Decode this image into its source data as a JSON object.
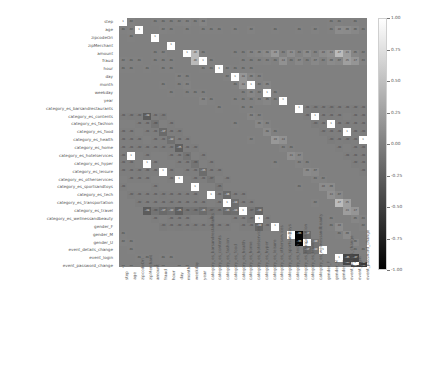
{
  "chart_data": {
    "type": "heatmap",
    "title": "",
    "xlabel": "",
    "ylabel": "",
    "grid": false,
    "legend_position": "right",
    "colormap": "gray",
    "annotated": true,
    "vmin": -1.0,
    "vmax": 1.0,
    "colorbar": {
      "ticks": [
        "1.00",
        "0.75",
        "0.50",
        "0.25",
        "0.00",
        "-0.25",
        "-0.50",
        "-0.75",
        "-1.00"
      ],
      "tick_values": [
        1.0,
        0.75,
        0.5,
        0.25,
        0.0,
        -0.25,
        -0.5,
        -0.75,
        -1.0
      ],
      "top_color": "#ffffff",
      "bottom_color": "#000000"
    },
    "categories": [
      "step",
      "age",
      "zipcodeOri",
      "zipMerchant",
      "amount",
      "fraud",
      "hour",
      "day",
      "month",
      "weekday",
      "year",
      "category_es_barsandrestaurants",
      "category_es_contents",
      "category_es_fashion",
      "category_es_food",
      "category_es_health",
      "category_es_home",
      "category_es_hotelservices",
      "category_es_hyper",
      "category_es_leisure",
      "category_es_otherservices",
      "category_es_sportsandtoys",
      "category_es_tech",
      "category_es_transportation",
      "category_es_travel",
      "category_es_wellnessandbeauty",
      "gender_F",
      "gender_M",
      "gender_U",
      "event_details_change",
      "event_login",
      "event_password_change"
    ],
    "xticklabels": [
      "step",
      "age",
      "zipcodeOri",
      "zipMerchant",
      "amount",
      "fraud",
      "hour",
      "day",
      "month",
      "weekday",
      "year",
      "category_es_barsandrestaurants",
      "category_es_contents",
      "category_es_fashion",
      "category_es_food",
      "category_es_health",
      "category_es_home",
      "category_es_hotelservices",
      "category_es_hyper",
      "category_es_leisure",
      "category_es_otherservices",
      "category_es_sportsandtoys",
      "category_es_tech",
      "category_es_transportation",
      "category_es_travel",
      "category_es_wellnessandbeauty",
      "gender_F",
      "gender_M",
      "gender_U",
      "event_details_change",
      "event_login",
      "event_password_change"
    ],
    "yticklabels": [
      "step",
      "age",
      "zipcodeOri",
      "zipMerchant",
      "amount",
      "fraud",
      "hour",
      "day",
      "month",
      "weekday",
      "year",
      "category_es_barsandrestaurants",
      "category_es_contents",
      "category_es_fashion",
      "category_es_food",
      "category_es_health",
      "category_es_home",
      "category_es_hotelservices",
      "category_es_hyper",
      "category_es_leisure",
      "category_es_otherservices",
      "category_es_sportsandtoys",
      "category_es_tech",
      "category_es_transportation",
      "category_es_travel",
      "category_es_wellnessandbeauty",
      "gender_F",
      "gender_M",
      "gender_U",
      "event_details_change",
      "event_login",
      "event_password_change"
    ],
    "matrix": [
      [
        1.0,
        0.02,
        0.0,
        0.0,
        0.01,
        0.01,
        0.01,
        0.02,
        0.03,
        0.01,
        0.04,
        0.0,
        0.0,
        0.0,
        0.0,
        0.0,
        0.0,
        0.0,
        0.0,
        0.0,
        0.0,
        0.0,
        0.0,
        0.0,
        0.0,
        0.0,
        0.01,
        0.01,
        0.0,
        0.01,
        0.0,
        0.01
      ],
      [
        0.02,
        1.0,
        0.0,
        0.0,
        0.02,
        0.01,
        0.0,
        0.01,
        0.0,
        0.01,
        0.01,
        0.01,
        0.0,
        0.01,
        0.0,
        0.02,
        0.0,
        0.0,
        0.01,
        0.0,
        0.0,
        0.01,
        0.0,
        0.02,
        0.0,
        0.01,
        0.1,
        0.09,
        0.06,
        0.01,
        0.0,
        0.01
      ],
      [
        0.0,
        0.0,
        1.0,
        0.0,
        0.0,
        0.0,
        0.0,
        0.0,
        0.0,
        0.0,
        0.0,
        0.0,
        0.0,
        0.0,
        0.0,
        0.0,
        0.0,
        0.0,
        0.0,
        0.0,
        0.0,
        0.0,
        0.0,
        0.0,
        0.0,
        0.0,
        0.0,
        0.0,
        0.0,
        0.0,
        0.0,
        0.0
      ],
      [
        0.0,
        0.0,
        0.0,
        1.0,
        0.0,
        0.0,
        0.0,
        0.0,
        0.0,
        0.0,
        0.0,
        0.0,
        0.0,
        0.0,
        0.0,
        0.0,
        0.0,
        0.0,
        0.0,
        0.0,
        0.0,
        0.0,
        0.0,
        0.0,
        0.0,
        0.0,
        0.0,
        0.0,
        0.0,
        0.0,
        0.0,
        0.0
      ],
      [
        0.01,
        0.02,
        0.0,
        0.0,
        1.0,
        0.46,
        0.01,
        0.0,
        0.0,
        0.0,
        0.01,
        0.01,
        0.04,
        0.06,
        0.08,
        0.19,
        0.03,
        0.11,
        0.03,
        0.09,
        0.03,
        0.1,
        0.13,
        0.47,
        0.23,
        0.05,
        0.02,
        0.02,
        0.01,
        0.01,
        0.0,
        0.01
      ],
      [
        0.01,
        0.01,
        0.0,
        0.0,
        0.46,
        1.0,
        0.01,
        0.0,
        0.0,
        0.0,
        0.01,
        0.01,
        0.02,
        0.03,
        0.01,
        0.14,
        0.01,
        0.07,
        0.01,
        0.07,
        0.02,
        0.09,
        0.07,
        0.25,
        0.17,
        0.03,
        0.01,
        0.01,
        0.0,
        0.01,
        0.0,
        0.01
      ],
      [
        0.01,
        0.0,
        0.0,
        0.0,
        0.01,
        0.01,
        1.0,
        0.02,
        0.01,
        0.01,
        0.01,
        0.0,
        0.0,
        0.0,
        0.0,
        0.0,
        0.0,
        0.0,
        0.0,
        0.0,
        0.0,
        0.0,
        0.0,
        0.0,
        0.0,
        0.0,
        0.0,
        0.0,
        0.0,
        0.0,
        0.0,
        0.0
      ],
      [
        0.02,
        0.01,
        0.0,
        0.0,
        0.0,
        0.0,
        0.02,
        1.0,
        0.18,
        0.06,
        0.03,
        0.0,
        0.0,
        0.0,
        0.0,
        0.0,
        0.0,
        0.0,
        0.0,
        0.0,
        0.0,
        0.0,
        0.0,
        0.0,
        0.0,
        0.0,
        0.0,
        0.0,
        0.0,
        0.01,
        0.0,
        0.01
      ],
      [
        0.03,
        0.0,
        0.0,
        0.0,
        0.0,
        0.0,
        0.01,
        0.18,
        1.0,
        0.02,
        0.05,
        0.0,
        0.0,
        0.0,
        0.0,
        0.0,
        0.0,
        0.0,
        0.0,
        0.0,
        0.0,
        0.0,
        0.0,
        0.0,
        0.0,
        0.0,
        0.0,
        0.0,
        0.0,
        0.01,
        0.0,
        0.01
      ],
      [
        0.01,
        0.01,
        0.0,
        0.0,
        0.0,
        0.0,
        0.01,
        0.06,
        0.02,
        1.0,
        0.01,
        0.0,
        0.0,
        0.0,
        0.0,
        0.0,
        0.0,
        0.0,
        0.0,
        0.0,
        0.0,
        0.0,
        0.0,
        0.0,
        0.0,
        0.0,
        0.0,
        0.0,
        0.0,
        0.0,
        0.0,
        0.0
      ],
      [
        0.04,
        0.01,
        0.0,
        0.0,
        0.01,
        0.01,
        0.01,
        0.03,
        0.05,
        0.01,
        1.0,
        0.0,
        0.0,
        0.0,
        0.0,
        0.0,
        0.0,
        0.0,
        0.0,
        0.0,
        0.0,
        0.0,
        0.0,
        0.0,
        0.0,
        0.0,
        0.0,
        0.0,
        0.0,
        0.0,
        0.0,
        0.0
      ],
      [
        0.0,
        0.01,
        0.0,
        0.0,
        0.01,
        0.01,
        0.0,
        0.0,
        0.0,
        0.0,
        0.0,
        1.0,
        -0.01,
        -0.03,
        -0.02,
        -0.03,
        -0.01,
        -0.01,
        -0.02,
        -0.01,
        -0.01,
        -0.02,
        -0.02,
        -0.28,
        -0.01,
        -0.03,
        0.0,
        0.0,
        0.0,
        0.0,
        0.0,
        0.0
      ],
      [
        0.0,
        0.0,
        0.0,
        0.0,
        0.04,
        0.02,
        0.0,
        0.0,
        0.0,
        0.0,
        0.0,
        -0.01,
        1.0,
        -0.01,
        -0.01,
        -0.01,
        0.0,
        -0.01,
        -0.01,
        0.0,
        0.0,
        -0.01,
        -0.01,
        -0.09,
        0.0,
        -0.01,
        0.0,
        0.0,
        0.0,
        0.0,
        0.0,
        0.0
      ],
      [
        0.0,
        0.01,
        0.0,
        0.0,
        0.06,
        0.03,
        0.0,
        0.0,
        0.0,
        0.0,
        0.0,
        -0.03,
        -0.01,
        1.0,
        -0.01,
        -0.02,
        -0.01,
        -0.01,
        -0.01,
        -0.01,
        0.0,
        -0.01,
        -0.01,
        -0.17,
        -0.01,
        -0.02,
        0.0,
        0.0,
        0.0,
        0.0,
        0.0,
        0.0
      ],
      [
        0.0,
        0.0,
        0.0,
        0.0,
        0.08,
        0.01,
        0.0,
        0.0,
        0.0,
        0.0,
        0.0,
        -0.02,
        -0.01,
        -0.01,
        1.0,
        -0.01,
        -0.01,
        -0.01,
        -0.01,
        -0.01,
        0.0,
        -0.01,
        -0.01,
        -0.12,
        -0.01,
        -0.01,
        0.0,
        0.0,
        0.0,
        0.0,
        0.0,
        0.0
      ],
      [
        0.0,
        0.02,
        0.0,
        0.0,
        0.19,
        0.14,
        0.0,
        0.0,
        0.0,
        0.0,
        0.0,
        -0.03,
        -0.01,
        -0.02,
        -0.01,
        1.0,
        -0.01,
        -0.01,
        -0.02,
        -0.01,
        -0.01,
        -0.02,
        -0.02,
        -0.25,
        -0.01,
        -0.02,
        0.0,
        0.0,
        0.0,
        0.0,
        0.0,
        0.0
      ],
      [
        0.0,
        0.0,
        0.0,
        0.0,
        0.03,
        0.01,
        0.0,
        0.0,
        0.0,
        0.0,
        0.0,
        -0.01,
        0.0,
        -0.01,
        -0.01,
        -0.01,
        1.0,
        0.0,
        -0.01,
        0.0,
        0.0,
        -0.01,
        -0.01,
        -0.08,
        0.0,
        -0.01,
        0.0,
        0.0,
        0.0,
        0.0,
        0.0,
        0.0
      ],
      [
        0.0,
        0.0,
        0.0,
        0.0,
        0.11,
        0.07,
        0.0,
        0.0,
        0.0,
        0.0,
        0.0,
        -0.01,
        -0.01,
        -0.01,
        -0.01,
        -0.01,
        0.0,
        1.0,
        -0.01,
        0.0,
        0.0,
        -0.01,
        -0.01,
        -0.09,
        0.0,
        -0.01,
        0.0,
        0.0,
        0.0,
        0.0,
        0.0,
        0.0
      ],
      [
        0.0,
        0.01,
        0.0,
        0.0,
        0.03,
        0.01,
        0.0,
        0.0,
        0.0,
        0.0,
        0.0,
        -0.02,
        -0.01,
        -0.01,
        -0.01,
        -0.02,
        -0.01,
        -0.01,
        1.0,
        -0.01,
        0.0,
        -0.01,
        -0.01,
        -0.15,
        -0.01,
        -0.01,
        0.0,
        0.0,
        0.0,
        0.0,
        0.0,
        0.0
      ],
      [
        0.0,
        0.0,
        0.0,
        0.0,
        0.09,
        0.07,
        0.0,
        0.0,
        0.0,
        0.0,
        0.0,
        -0.01,
        0.0,
        -0.01,
        -0.01,
        -0.01,
        0.0,
        0.0,
        -0.01,
        1.0,
        0.0,
        -0.01,
        -0.01,
        -0.07,
        0.0,
        -0.01,
        0.0,
        0.0,
        0.0,
        0.0,
        0.0,
        0.0
      ],
      [
        0.0,
        0.0,
        0.0,
        0.0,
        0.03,
        0.02,
        0.0,
        0.0,
        0.0,
        0.0,
        0.0,
        -0.01,
        0.0,
        0.0,
        0.0,
        -0.01,
        0.0,
        0.0,
        0.0,
        0.0,
        1.0,
        0.0,
        0.0,
        -0.05,
        0.0,
        0.0,
        0.0,
        0.0,
        0.0,
        0.0,
        0.0,
        0.0
      ],
      [
        0.0,
        0.01,
        0.0,
        0.0,
        0.1,
        0.09,
        0.0,
        0.0,
        0.0,
        0.0,
        0.0,
        -0.02,
        -0.01,
        -0.01,
        -0.01,
        -0.02,
        -0.01,
        -0.01,
        -0.01,
        -0.01,
        0.0,
        1.0,
        -0.01,
        -0.16,
        -0.01,
        -0.01,
        0.0,
        0.0,
        0.0,
        0.0,
        0.0,
        0.0
      ],
      [
        0.0,
        0.0,
        0.0,
        0.0,
        0.13,
        0.07,
        0.0,
        0.0,
        0.0,
        0.0,
        0.0,
        -0.02,
        -0.01,
        -0.01,
        -0.01,
        -0.02,
        -0.01,
        -0.01,
        -0.01,
        -0.01,
        0.0,
        -0.01,
        1.0,
        -0.14,
        -0.01,
        -0.01,
        0.0,
        0.0,
        0.0,
        0.0,
        0.0,
        0.0
      ],
      [
        0.0,
        0.02,
        0.0,
        0.0,
        0.47,
        0.25,
        0.0,
        0.0,
        0.0,
        0.0,
        0.0,
        -0.28,
        -0.09,
        -0.17,
        -0.12,
        -0.25,
        -0.08,
        -0.09,
        -0.15,
        -0.07,
        -0.05,
        -0.16,
        -0.14,
        1.0,
        -0.07,
        -0.19,
        0.0,
        0.0,
        0.0,
        0.0,
        0.0,
        0.0
      ],
      [
        0.0,
        0.0,
        0.0,
        0.0,
        0.23,
        0.17,
        0.0,
        0.0,
        0.0,
        0.0,
        0.0,
        -0.01,
        0.0,
        -0.01,
        -0.01,
        -0.01,
        0.0,
        0.0,
        -0.01,
        0.0,
        0.0,
        -0.01,
        -0.01,
        -0.07,
        1.0,
        -0.01,
        0.0,
        0.0,
        0.0,
        0.0,
        0.0,
        0.0
      ],
      [
        0.0,
        0.01,
        0.0,
        0.0,
        0.05,
        0.03,
        0.0,
        0.0,
        0.0,
        0.0,
        0.0,
        -0.03,
        -0.01,
        -0.02,
        -0.01,
        -0.02,
        -0.01,
        -0.01,
        -0.01,
        -0.01,
        0.0,
        -0.01,
        -0.01,
        -0.19,
        -0.01,
        1.0,
        0.0,
        0.0,
        0.0,
        0.0,
        0.0,
        0.0
      ],
      [
        0.01,
        0.1,
        0.0,
        0.0,
        0.02,
        0.01,
        0.0,
        0.0,
        0.0,
        0.0,
        0.0,
        0.0,
        0.0,
        0.0,
        0.0,
        0.0,
        0.0,
        0.0,
        0.0,
        0.0,
        0.0,
        0.0,
        0.0,
        0.0,
        0.0,
        0.0,
        1.0,
        -0.96,
        -0.17,
        0.0,
        0.0,
        0.0
      ],
      [
        0.01,
        0.09,
        0.0,
        0.0,
        0.02,
        0.01,
        0.0,
        0.0,
        0.0,
        0.0,
        0.0,
        0.0,
        0.0,
        0.0,
        0.0,
        0.0,
        0.0,
        0.0,
        0.0,
        0.0,
        0.0,
        0.0,
        0.0,
        0.0,
        0.0,
        0.0,
        -0.96,
        1.0,
        -0.1,
        0.0,
        0.0,
        0.0
      ],
      [
        0.0,
        0.06,
        0.0,
        0.0,
        0.01,
        0.0,
        0.0,
        0.0,
        0.0,
        0.0,
        0.0,
        0.0,
        0.0,
        0.0,
        0.0,
        0.0,
        0.0,
        0.0,
        0.0,
        0.0,
        0.0,
        0.0,
        0.0,
        0.0,
        0.0,
        0.0,
        -0.17,
        -0.1,
        1.0,
        0.0,
        0.0,
        0.0
      ],
      [
        0.01,
        0.01,
        0.0,
        0.0,
        0.01,
        0.01,
        0.0,
        0.01,
        0.01,
        0.0,
        0.0,
        0.0,
        0.0,
        0.0,
        0.0,
        0.0,
        0.0,
        0.0,
        0.0,
        0.0,
        0.0,
        0.0,
        0.0,
        0.0,
        0.0,
        0.0,
        0.0,
        0.0,
        0.0,
        1.0,
        -0.45,
        -0.47
      ],
      [
        0.0,
        0.0,
        0.0,
        0.0,
        0.0,
        0.0,
        0.0,
        0.0,
        0.0,
        0.0,
        0.0,
        0.0,
        0.0,
        0.0,
        0.0,
        0.0,
        0.0,
        0.0,
        0.0,
        0.0,
        0.0,
        0.0,
        0.0,
        0.0,
        0.0,
        0.0,
        0.0,
        0.0,
        0.0,
        -0.45,
        1.0,
        -0.55
      ],
      [
        0.01,
        0.01,
        0.0,
        0.0,
        0.01,
        0.01,
        0.0,
        0.01,
        0.01,
        0.0,
        0.0,
        0.0,
        0.0,
        0.0,
        0.0,
        0.0,
        0.0,
        0.0,
        0.0,
        0.0,
        0.0,
        0.0,
        0.0,
        0.0,
        0.0,
        0.0,
        0.0,
        0.0,
        0.0,
        -0.47,
        -0.55,
        1.0
      ]
    ]
  }
}
